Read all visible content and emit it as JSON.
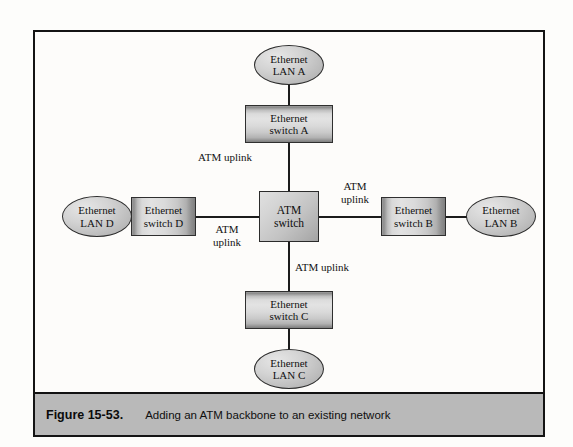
{
  "figure": {
    "caption_number": "Figure 15-53.",
    "caption_text": "Adding an ATM backbone to an existing network",
    "frame_color": "#141414",
    "caption_bar_color": "#b9b9b9"
  },
  "diagram": {
    "type": "network-topology",
    "center": {
      "name": "atm-switch",
      "label_line1": "ATM",
      "label_line2": "switch"
    },
    "switches": [
      {
        "id": "switch-a",
        "label_line1": "Ethernet",
        "label_line2": "switch A",
        "orientation": "vertical",
        "position": "top"
      },
      {
        "id": "switch-b",
        "label_line1": "Ethernet",
        "label_line2": "switch B",
        "orientation": "horizontal",
        "position": "right"
      },
      {
        "id": "switch-c",
        "label_line1": "Ethernet",
        "label_line2": "switch C",
        "orientation": "vertical",
        "position": "bottom"
      },
      {
        "id": "switch-d",
        "label_line1": "Ethernet",
        "label_line2": "switch D",
        "orientation": "horizontal",
        "position": "left"
      }
    ],
    "lans": [
      {
        "id": "lan-a",
        "label_line1": "Ethernet",
        "label_line2": "LAN A",
        "position": "top"
      },
      {
        "id": "lan-b",
        "label_line1": "Ethernet",
        "label_line2": "LAN B",
        "position": "right"
      },
      {
        "id": "lan-c",
        "label_line1": "Ethernet",
        "label_line2": "LAN C",
        "position": "bottom"
      },
      {
        "id": "lan-d",
        "label_line1": "Ethernet",
        "label_line2": "LAN D",
        "position": "left"
      }
    ],
    "uplinks": [
      {
        "id": "uplink-a",
        "text": "ATM uplink",
        "lines": 1,
        "connects": "switch-a to atm-switch"
      },
      {
        "id": "uplink-b",
        "text": "ATM uplink",
        "lines": 2,
        "line1": "ATM",
        "line2": "uplink",
        "connects": "atm-switch to switch-b"
      },
      {
        "id": "uplink-c",
        "text": "ATM uplink",
        "lines": 1,
        "connects": "atm-switch to switch-c"
      },
      {
        "id": "uplink-d",
        "text": "ATM uplink",
        "lines": 2,
        "line1": "ATM",
        "line2": "uplink",
        "connects": "switch-d to atm-switch"
      }
    ],
    "colors": {
      "line": "#1c1c1c",
      "node_fill_light": "#e3e3e3",
      "node_fill_dark": "#8f8f8f"
    }
  }
}
